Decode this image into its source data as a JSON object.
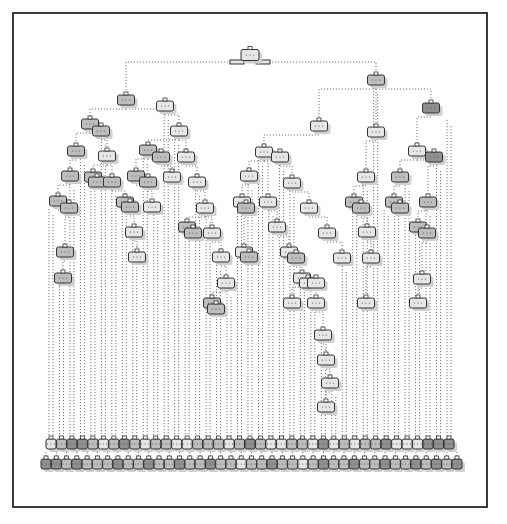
{
  "diagram": {
    "type": "decision-tree",
    "frame": {
      "border_color": "#3a3a3a"
    },
    "colors": {
      "light": "#e6e6e6",
      "mid": "#bdbdbd",
      "dark": "#8f8f8f",
      "edge": "#777777",
      "shadow": "#cfcfcf"
    },
    "root": {
      "x": 250,
      "y": 55
    },
    "root_side_boxes": [
      {
        "x": 237,
        "y": 62
      },
      {
        "x": 263,
        "y": 62
      }
    ],
    "internal_nodes": [
      {
        "x": 126,
        "y": 100,
        "c": "mid"
      },
      {
        "x": 165,
        "y": 106,
        "c": "light"
      },
      {
        "x": 376,
        "y": 80,
        "c": "mid"
      },
      {
        "x": 431,
        "y": 108,
        "c": "dark"
      },
      {
        "x": 319,
        "y": 126,
        "c": "light"
      },
      {
        "x": 376,
        "y": 132,
        "c": "light"
      },
      {
        "x": 90,
        "y": 124,
        "c": "mid"
      },
      {
        "x": 101,
        "y": 131,
        "c": "mid"
      },
      {
        "x": 179,
        "y": 131,
        "c": "light"
      },
      {
        "x": 76,
        "y": 151,
        "c": "mid"
      },
      {
        "x": 107,
        "y": 156,
        "c": "light"
      },
      {
        "x": 148,
        "y": 150,
        "c": "mid"
      },
      {
        "x": 161,
        "y": 157,
        "c": "mid"
      },
      {
        "x": 186,
        "y": 157,
        "c": "light"
      },
      {
        "x": 264,
        "y": 152,
        "c": "light"
      },
      {
        "x": 280,
        "y": 157,
        "c": "light"
      },
      {
        "x": 417,
        "y": 151,
        "c": "light"
      },
      {
        "x": 434,
        "y": 157,
        "c": "dark"
      },
      {
        "x": 70,
        "y": 176,
        "c": "mid"
      },
      {
        "x": 93,
        "y": 177,
        "c": "mid"
      },
      {
        "x": 97,
        "y": 182,
        "c": "mid"
      },
      {
        "x": 112,
        "y": 182,
        "c": "mid"
      },
      {
        "x": 136,
        "y": 176,
        "c": "mid"
      },
      {
        "x": 148,
        "y": 182,
        "c": "mid"
      },
      {
        "x": 172,
        "y": 177,
        "c": "light"
      },
      {
        "x": 197,
        "y": 182,
        "c": "light"
      },
      {
        "x": 249,
        "y": 176,
        "c": "light"
      },
      {
        "x": 292,
        "y": 183,
        "c": "light"
      },
      {
        "x": 366,
        "y": 177,
        "c": "light"
      },
      {
        "x": 400,
        "y": 177,
        "c": "mid"
      },
      {
        "x": 58,
        "y": 201,
        "c": "mid"
      },
      {
        "x": 69,
        "y": 208,
        "c": "mid"
      },
      {
        "x": 125,
        "y": 202,
        "c": "mid"
      },
      {
        "x": 130,
        "y": 207,
        "c": "mid"
      },
      {
        "x": 152,
        "y": 207,
        "c": "light"
      },
      {
        "x": 205,
        "y": 208,
        "c": "light"
      },
      {
        "x": 242,
        "y": 202,
        "c": "light"
      },
      {
        "x": 246,
        "y": 208,
        "c": "mid"
      },
      {
        "x": 268,
        "y": 202,
        "c": "light"
      },
      {
        "x": 309,
        "y": 208,
        "c": "light"
      },
      {
        "x": 354,
        "y": 202,
        "c": "mid"
      },
      {
        "x": 361,
        "y": 208,
        "c": "mid"
      },
      {
        "x": 394,
        "y": 202,
        "c": "mid"
      },
      {
        "x": 400,
        "y": 208,
        "c": "mid"
      },
      {
        "x": 428,
        "y": 202,
        "c": "mid"
      },
      {
        "x": 134,
        "y": 232,
        "c": "light"
      },
      {
        "x": 187,
        "y": 227,
        "c": "mid"
      },
      {
        "x": 193,
        "y": 233,
        "c": "mid"
      },
      {
        "x": 212,
        "y": 233,
        "c": "light"
      },
      {
        "x": 277,
        "y": 227,
        "c": "light"
      },
      {
        "x": 327,
        "y": 233,
        "c": "light"
      },
      {
        "x": 367,
        "y": 232,
        "c": "light"
      },
      {
        "x": 418,
        "y": 227,
        "c": "mid"
      },
      {
        "x": 427,
        "y": 233,
        "c": "mid"
      },
      {
        "x": 65,
        "y": 252,
        "c": "mid"
      },
      {
        "x": 137,
        "y": 257,
        "c": "light"
      },
      {
        "x": 221,
        "y": 257,
        "c": "light"
      },
      {
        "x": 244,
        "y": 252,
        "c": "light"
      },
      {
        "x": 249,
        "y": 257,
        "c": "mid"
      },
      {
        "x": 289,
        "y": 252,
        "c": "light"
      },
      {
        "x": 296,
        "y": 258,
        "c": "mid"
      },
      {
        "x": 342,
        "y": 258,
        "c": "light"
      },
      {
        "x": 371,
        "y": 258,
        "c": "light"
      },
      {
        "x": 63,
        "y": 278,
        "c": "mid"
      },
      {
        "x": 226,
        "y": 283,
        "c": "light"
      },
      {
        "x": 302,
        "y": 278,
        "c": "light"
      },
      {
        "x": 308,
        "y": 283,
        "c": "light"
      },
      {
        "x": 316,
        "y": 283,
        "c": "light"
      },
      {
        "x": 422,
        "y": 279,
        "c": "light"
      },
      {
        "x": 212,
        "y": 303,
        "c": "mid"
      },
      {
        "x": 216,
        "y": 309,
        "c": "mid"
      },
      {
        "x": 292,
        "y": 303,
        "c": "light"
      },
      {
        "x": 316,
        "y": 303,
        "c": "light"
      },
      {
        "x": 366,
        "y": 303,
        "c": "light"
      },
      {
        "x": 418,
        "y": 303,
        "c": "light"
      },
      {
        "x": 323,
        "y": 335,
        "c": "light"
      },
      {
        "x": 326,
        "y": 360,
        "c": "light"
      },
      {
        "x": 330,
        "y": 383,
        "c": "light"
      },
      {
        "x": 326,
        "y": 407,
        "c": "light"
      }
    ],
    "leaf_rows": [
      {
        "y": 444,
        "x_start": 51,
        "x_end": 449,
        "count": 39,
        "shades": [
          "light",
          "mid",
          "dark",
          "dark",
          "mid",
          "light",
          "mid",
          "dark",
          "mid",
          "light",
          "mid",
          "mid",
          "light",
          "light",
          "mid",
          "mid",
          "mid",
          "light",
          "mid",
          "dark",
          "mid",
          "light",
          "light",
          "mid",
          "mid",
          "light",
          "dark",
          "light",
          "mid",
          "light",
          "mid",
          "mid",
          "dark",
          "light",
          "light",
          "light",
          "dark",
          "dark",
          "dark"
        ]
      },
      {
        "y": 464,
        "x_start": 46,
        "x_end": 457,
        "count": 41,
        "shades": [
          "dark",
          "dark",
          "mid",
          "dark",
          "mid",
          "mid",
          "mid",
          "dark",
          "mid",
          "mid",
          "dark",
          "mid",
          "mid",
          "dark",
          "mid",
          "mid",
          "dark",
          "mid",
          "mid",
          "light",
          "mid",
          "mid",
          "dark",
          "mid",
          "mid",
          "light",
          "mid",
          "dark",
          "mid",
          "mid",
          "dark",
          "mid",
          "mid",
          "dark",
          "mid",
          "mid",
          "dark",
          "mid",
          "dark",
          "mid",
          "dark"
        ]
      }
    ]
  }
}
